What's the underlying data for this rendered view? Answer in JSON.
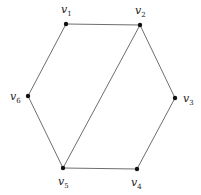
{
  "graph": {
    "vertices": [
      {
        "id": "v1",
        "name": "v",
        "sub": "1",
        "x": 66,
        "y": 24,
        "lx": 61,
        "ly": 13
      },
      {
        "id": "v2",
        "name": "v",
        "sub": "2",
        "x": 140,
        "y": 25,
        "lx": 135,
        "ly": 14
      },
      {
        "id": "v3",
        "name": "v",
        "sub": "3",
        "x": 175,
        "y": 98,
        "lx": 183,
        "ly": 102
      },
      {
        "id": "v4",
        "name": "v",
        "sub": "4",
        "x": 137,
        "y": 169,
        "lx": 131,
        "ly": 186
      },
      {
        "id": "v5",
        "name": "v",
        "sub": "5",
        "x": 63,
        "y": 168,
        "lx": 58,
        "ly": 185
      },
      {
        "id": "v6",
        "name": "v",
        "sub": "6",
        "x": 28,
        "y": 96,
        "lx": 10,
        "ly": 100
      }
    ],
    "edges": [
      [
        "v1",
        "v2"
      ],
      [
        "v2",
        "v3"
      ],
      [
        "v3",
        "v4"
      ],
      [
        "v4",
        "v5"
      ],
      [
        "v5",
        "v6"
      ],
      [
        "v6",
        "v1"
      ],
      [
        "v2",
        "v5"
      ]
    ],
    "colors": {
      "edge": "#6e6e6e",
      "vertex": "#111111",
      "label": "#222222"
    }
  }
}
